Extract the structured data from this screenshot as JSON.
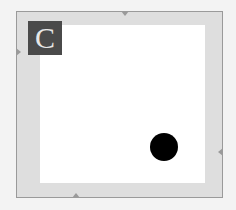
{
  "game": {
    "board": {
      "frame_color": "#dedede",
      "border_color": "#9a9a9a",
      "field_color": "#ffffff"
    },
    "label": {
      "text": "C",
      "background": "#4a4a4a",
      "color": "#e6e6e6"
    },
    "token": {
      "shape": "circle",
      "color": "#000000",
      "center": [
        164,
        147
      ],
      "radius": 14
    }
  }
}
